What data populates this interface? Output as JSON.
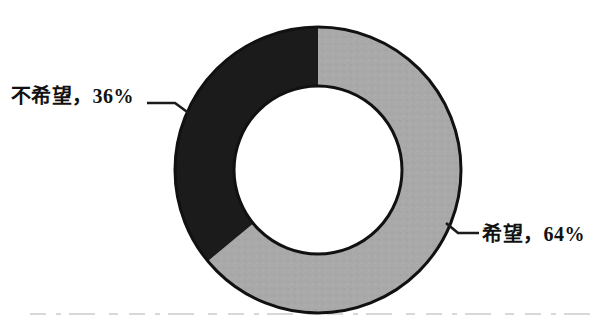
{
  "chart_data": {
    "type": "pie",
    "donut": true,
    "title": "",
    "categories": [
      "希望",
      "不希望"
    ],
    "values": [
      64,
      36
    ],
    "unit": "%",
    "slice_colors": [
      "#a9a9a9",
      "#1b1b1b"
    ],
    "slice_textures": [
      "speckled",
      "solid"
    ],
    "outline_color": "#111111",
    "leader_line_color": "#1b1b1b",
    "background": "#ffffff",
    "start_angle_deg": 0,
    "direction": "clockwise",
    "inner_radius_ratio": 0.587,
    "legend": "none",
    "data_labels": [
      {
        "slice": "希望",
        "text": "希望，64%",
        "side": "right"
      },
      {
        "slice": "不希望",
        "text": "不希望，36%",
        "side": "left"
      }
    ]
  }
}
